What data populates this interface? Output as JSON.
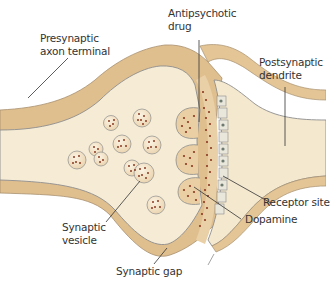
{
  "diagram": {
    "type": "synapse-cross-section",
    "colors": {
      "membrane": "#e2c49a",
      "membrane_dark": "#c9a06a",
      "cytoplasm": "#f7eedb",
      "outline": "#9a9a9a",
      "vesicle_dot": "#8a3a22",
      "leader_line": "#333333",
      "receptor": "#d8d8d0",
      "background": "#ffffff"
    },
    "labels": [
      {
        "id": "presynaptic",
        "text": "Presynaptic\naxon terminal"
      },
      {
        "id": "antipsychotic",
        "text": "Antipsychotic\ndrug"
      },
      {
        "id": "postsynaptic",
        "text": "Postsynaptic\ndendrite"
      },
      {
        "id": "receptor",
        "text": "Receptor site"
      },
      {
        "id": "dopamine",
        "text": "Dopamine"
      },
      {
        "id": "vesicle",
        "text": "Synaptic\nvesicle"
      },
      {
        "id": "gap",
        "text": "Synaptic gap"
      }
    ]
  }
}
